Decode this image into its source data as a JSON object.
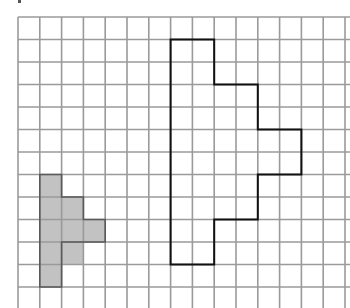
{
  "grid": {
    "origin_x": 18,
    "origin_y": 17,
    "cell_w": 21.8,
    "cell_h": 22.5,
    "cols": 15,
    "rows": 13,
    "line_color": "#9a9a9a",
    "line_width": 1.6
  },
  "shaded_shape": {
    "fill": "#c2c2c2",
    "stroke": "#5a5a5a",
    "cells": [
      [
        1,
        7
      ],
      [
        1,
        8
      ],
      [
        1,
        9
      ],
      [
        1,
        10
      ],
      [
        1,
        11
      ],
      [
        2,
        8
      ],
      [
        2,
        9
      ],
      [
        2,
        10
      ],
      [
        3,
        9
      ]
    ]
  },
  "outlined_shape": {
    "stroke": "#111111",
    "stroke_width": 2,
    "vertices": [
      [
        7,
        1
      ],
      [
        9,
        1
      ],
      [
        9,
        3
      ],
      [
        11,
        3
      ],
      [
        11,
        5
      ],
      [
        13,
        5
      ],
      [
        13,
        7
      ],
      [
        11,
        7
      ],
      [
        11,
        9
      ],
      [
        9,
        9
      ],
      [
        9,
        11
      ],
      [
        7,
        11
      ]
    ]
  }
}
